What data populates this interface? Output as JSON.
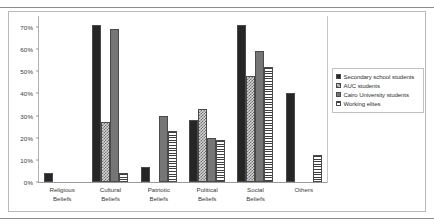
{
  "chart_data": {
    "type": "bar",
    "title": "",
    "xlabel": "",
    "ylabel": "",
    "ylim": [
      0,
      75
    ],
    "grid": false,
    "legend_position": "right",
    "ytick_labels": [
      "0%",
      "10%",
      "20%",
      "30%",
      "40%",
      "50%",
      "60%",
      "70%"
    ],
    "ytick_values": [
      0,
      10,
      20,
      30,
      40,
      50,
      60,
      70
    ],
    "categories": [
      "Religious\nBeliefs",
      "Cultural\nBeliefs",
      "Patriotic\nBeliefs",
      "Political\nBeliefs",
      "Social\nBeliefs",
      "Others"
    ],
    "series": [
      {
        "name": "Secondary school students",
        "fill": "solid-dark",
        "color": "#262626",
        "values": [
          4,
          71,
          7,
          28,
          71,
          40
        ]
      },
      {
        "name": "AUC students",
        "fill": "checkerboard",
        "color": "#6f6f6f",
        "values": [
          0,
          27,
          0,
          33,
          48,
          0
        ]
      },
      {
        "name": "Cairo University students",
        "fill": "solid-gray",
        "color": "#767676",
        "values": [
          0,
          69,
          30,
          20,
          59,
          0
        ]
      },
      {
        "name": "Working elites",
        "fill": "horizontal-stripes",
        "color": "#3f3f3f",
        "values": [
          0,
          4,
          23,
          19,
          52,
          12
        ]
      }
    ]
  }
}
